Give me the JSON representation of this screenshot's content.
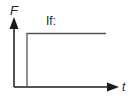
{
  "diagram": {
    "y_axis_label": "F",
    "x_axis_label": "t",
    "annotation": "If:",
    "colors": {
      "axis": "#1a1a1a",
      "step": "#555555",
      "background": "#ffffff"
    },
    "step": {
      "type": "step-function",
      "description": "Force F jumps from 0 to a constant value shortly after t=0 and stays constant"
    }
  }
}
